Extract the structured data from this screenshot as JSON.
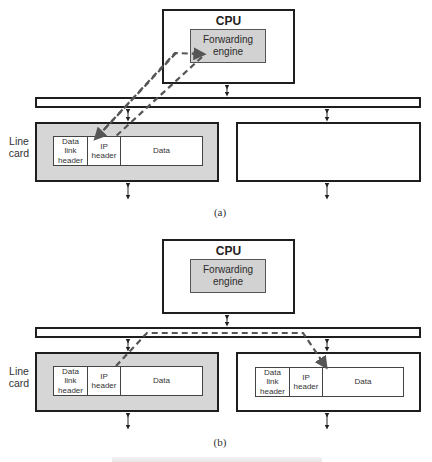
{
  "figure": {
    "caption_visible": false,
    "colors": {
      "outline": "#1e1e1e",
      "line_card_fill": "#d6d6d6",
      "engine_fill": "#d2d2d2",
      "dashed_path": "#555555"
    }
  },
  "panel_a": {
    "sublabel": "(a)",
    "cpu": {
      "title": "CPU",
      "engine": "Forwarding\nengine"
    },
    "line_card_label": "Line\ncard",
    "left_card": {
      "packet": {
        "fields": [
          "Data\nlink\nheader",
          "IP\nheader",
          "Data"
        ]
      }
    },
    "right_card": {
      "packet": null
    },
    "path_description": "Packet header sent from line card across bus to CPU forwarding engine and back"
  },
  "panel_b": {
    "sublabel": "(b)",
    "cpu": {
      "title": "CPU",
      "engine": "Forwarding\nengine"
    },
    "line_card_label": "Line\ncard",
    "left_card": {
      "packet": {
        "fields": [
          "Data\nlink\nheader",
          "IP\nheader",
          "Data"
        ]
      }
    },
    "right_card": {
      "packet": {
        "fields": [
          "Data\nlink\nheader",
          "IP\nheader",
          "Data"
        ]
      }
    },
    "path_description": "Packet forwarded directly from left line card across bus to right line card"
  }
}
